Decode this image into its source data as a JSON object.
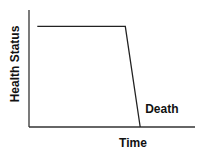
{
  "chart_data": {
    "type": "line",
    "title": "",
    "xlabel": "Time",
    "ylabel": "Health Status",
    "xlim": [
      0,
      1
    ],
    "ylim": [
      0,
      1
    ],
    "grid": false,
    "legend": "none",
    "series": [
      {
        "name": "Health trajectory",
        "points": [
          {
            "x": 0.05,
            "y": 0.86
          },
          {
            "x": 0.58,
            "y": 0.86
          },
          {
            "x": 0.67,
            "y": 0.0
          }
        ]
      }
    ],
    "annotations": [
      {
        "text": "Death",
        "x": 0.7,
        "y": 0.12
      }
    ],
    "colors": {
      "line": "#222222",
      "axis": "#333333",
      "text": "#111111"
    }
  }
}
